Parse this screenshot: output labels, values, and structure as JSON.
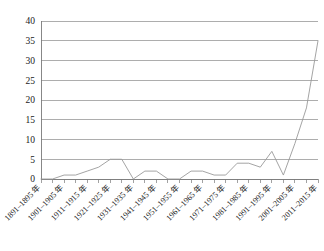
{
  "chart_data": {
    "type": "line",
    "title": "",
    "subtitle": "",
    "xlabel": "",
    "ylabel": "",
    "ylim": [
      0,
      40
    ],
    "yticks": [
      0,
      5,
      10,
      15,
      20,
      25,
      30,
      35,
      40
    ],
    "grid": true,
    "legend": false,
    "legend_position": "none",
    "line_color": "#9a9a9a",
    "grid_color": "#8a8a8a",
    "axis_color": "#7a7a7a",
    "categories": [
      "1891–1895 年",
      "1896–1900 年",
      "1901–1905 年",
      "1906–1910 年",
      "1911–1915 年",
      "1916–1920 年",
      "1921–1925 年",
      "1926–1930 年",
      "1931–1935 年",
      "1936–1940 年",
      "1941–1945 年",
      "1946–1950 年",
      "1951–1955 年",
      "1956–1960 年",
      "1961–1965 年",
      "1966–1970 年",
      "1971–1975 年",
      "1976–1980 年",
      "1981–1985 年",
      "1986–1990 年",
      "1991–1995 年",
      "1996–2000 年",
      "2001–2005 年",
      "2006–2010 年",
      "2011–2015 年"
    ],
    "visible_tick_labels": [
      "1891–1895 年",
      "1901–1905 年",
      "1911–1915 年",
      "1921–1925 年",
      "1931–1935 年",
      "1941–1945 年",
      "1951–1955 年",
      "1961–1965 年",
      "1971–1975 年",
      "1981–1985 年",
      "1991–1995 年",
      "2001–2005 年",
      "2011–2015 年"
    ],
    "values": [
      0,
      0,
      1,
      1,
      2,
      3,
      5,
      5,
      0,
      2,
      2,
      0,
      0,
      2,
      2,
      1,
      1,
      4,
      4,
      3,
      7,
      1,
      9,
      18,
      35
    ]
  }
}
